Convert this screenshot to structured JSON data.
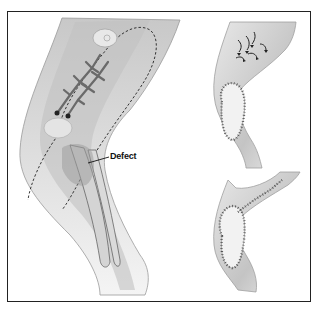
{
  "figure": {
    "panels": [
      {
        "id": "left",
        "description": "knee with dashed flap outline, vessel branching, tibia/fibula, defect region"
      },
      {
        "id": "top-right",
        "description": "flap rotated into defect with advancement arrows and sutures"
      },
      {
        "id": "bottom-right",
        "description": "flap inset, fully sutured, donor site closed"
      }
    ],
    "labels": {
      "defect": "Defect"
    },
    "colors": {
      "border": "#222222",
      "skin_light": "#e6e6e6",
      "skin_mid": "#c8c8c8",
      "skin_dark": "#a8a8a8",
      "vessel": "#6a6a6a",
      "suture": "#333333"
    }
  }
}
